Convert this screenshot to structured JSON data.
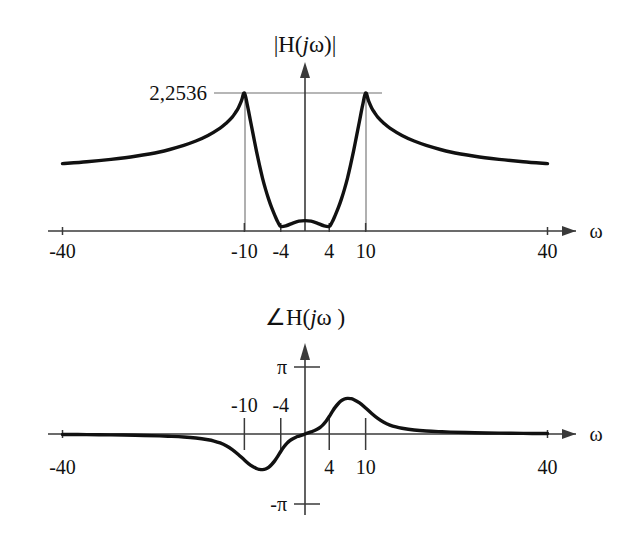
{
  "figure": {
    "axis_variable": "ω",
    "curve_color": "#111111",
    "axis_color": "#3a3a3a",
    "guide_color": "#6f6f6f",
    "background": "#ffffff"
  },
  "magnitude_plot": {
    "title_parts": {
      "pre": "|H(",
      "italic": "j",
      "post": "ω)|"
    },
    "title_text": "|H(jω)|",
    "axis_label": "ω",
    "peak_label": "2,2536",
    "x_tick_labels": [
      "-40",
      "-10",
      "-4",
      "4",
      "10",
      "40"
    ]
  },
  "phase_plot": {
    "title_parts": {
      "pre": "∠H(",
      "italic": "j",
      "post": "ω )"
    },
    "title_text": "∠H(jω )",
    "axis_label": "ω",
    "x_tick_labels": [
      "-40",
      "-10",
      "-4",
      "4",
      "10",
      "40"
    ],
    "y_tick_labels": [
      "π",
      "-π"
    ]
  },
  "chart_data": [
    {
      "type": "line",
      "id": "magnitude",
      "title": "|H(jω)|",
      "xlabel": "ω",
      "ylabel": "|H(jω)|",
      "xlim": [
        -40,
        40
      ],
      "ylim": [
        0,
        2.2536
      ],
      "grid": false,
      "legend": null,
      "xticks": [
        -40,
        -10,
        -4,
        4,
        10,
        40
      ],
      "xticklabels": [
        "-40",
        "-10",
        "-4",
        "4",
        "10",
        "40"
      ],
      "yticks": [
        2.2536
      ],
      "yticklabels": [
        "2,2536"
      ],
      "annotations": [
        {
          "text": "2,2536",
          "x": -16,
          "y": 2.2536,
          "note": "peak value guide line drawn from label across both resonance peaks"
        }
      ],
      "x": [
        -40,
        -36,
        -32,
        -28,
        -24,
        -20,
        -18,
        -16,
        -14,
        -13,
        -12,
        -11.5,
        -11,
        -10.5,
        -10,
        -9.5,
        -9,
        -8.5,
        -8,
        -7.5,
        -7,
        -6.5,
        -6,
        -5.5,
        -5,
        -4.5,
        -4,
        -3,
        -2,
        -1,
        0,
        1,
        2,
        3,
        4,
        4.5,
        5,
        5.5,
        6,
        6.5,
        7,
        7.5,
        8,
        8.5,
        9,
        9.5,
        10,
        10.5,
        11,
        11.5,
        12,
        13,
        14,
        16,
        18,
        20,
        24,
        28,
        32,
        36,
        40
      ],
      "y": [
        1.1,
        1.13,
        1.17,
        1.22,
        1.29,
        1.4,
        1.47,
        1.56,
        1.68,
        1.76,
        1.86,
        1.93,
        2.01,
        2.12,
        2.2536,
        2.05,
        1.8,
        1.55,
        1.3,
        1.07,
        0.86,
        0.68,
        0.52,
        0.38,
        0.26,
        0.15,
        0.075,
        0.09,
        0.13,
        0.16,
        0.17,
        0.16,
        0.13,
        0.09,
        0.075,
        0.15,
        0.26,
        0.38,
        0.52,
        0.68,
        0.86,
        1.07,
        1.3,
        1.55,
        1.8,
        2.05,
        2.2536,
        2.12,
        2.01,
        1.93,
        1.86,
        1.76,
        1.68,
        1.56,
        1.47,
        1.4,
        1.29,
        1.22,
        1.17,
        1.13,
        1.1
      ],
      "series_note": "Band-stop / twin-resonance magnitude response: peaks of 2,2536 at ω=±10, notch floor near ω=±4 with small local rise at ω=0, flat tails of about 1.1 at ω=±40."
    },
    {
      "type": "line",
      "id": "phase",
      "title": "∠H(jω )",
      "xlabel": "ω",
      "ylabel": "∠H(jω)",
      "xlim": [
        -40,
        40
      ],
      "ylim": [
        -3.14159,
        3.14159
      ],
      "grid": false,
      "legend": null,
      "xticks": [
        -40,
        -10,
        -4,
        4,
        10,
        40
      ],
      "xticklabels": [
        "-40",
        "-10",
        "-4",
        "4",
        "10",
        "40"
      ],
      "yticks": [
        3.14159,
        -3.14159
      ],
      "yticklabels": [
        "π",
        "-π"
      ],
      "x": [
        -40,
        -36,
        -32,
        -28,
        -24,
        -22,
        -20,
        -18,
        -16,
        -15,
        -14,
        -13,
        -12,
        -11,
        -10,
        -9,
        -8,
        -7.5,
        -7,
        -6.5,
        -6,
        -5.5,
        -5,
        -4.5,
        -4,
        -3.5,
        -3,
        -2.5,
        -2,
        -1.5,
        -1,
        -0.5,
        0,
        0.5,
        1,
        1.5,
        2,
        2.5,
        3,
        3.5,
        4,
        4.5,
        5,
        5.5,
        6,
        6.5,
        7,
        7.5,
        8,
        9,
        10,
        11,
        12,
        13,
        14,
        15,
        16,
        18,
        20,
        22,
        24,
        28,
        32,
        36,
        40
      ],
      "y": [
        -0.02,
        -0.03,
        -0.04,
        -0.06,
        -0.09,
        -0.11,
        -0.14,
        -0.19,
        -0.27,
        -0.33,
        -0.42,
        -0.55,
        -0.73,
        -0.96,
        -1.22,
        -1.46,
        -1.62,
        -1.66,
        -1.67,
        -1.64,
        -1.56,
        -1.43,
        -1.26,
        -1.05,
        -0.82,
        -0.61,
        -0.44,
        -0.31,
        -0.22,
        -0.15,
        -0.1,
        -0.05,
        0.0,
        0.05,
        0.1,
        0.15,
        0.22,
        0.31,
        0.44,
        0.61,
        0.82,
        1.05,
        1.26,
        1.43,
        1.56,
        1.64,
        1.67,
        1.66,
        1.62,
        1.46,
        1.22,
        0.96,
        0.73,
        0.55,
        0.42,
        0.33,
        0.27,
        0.19,
        0.14,
        0.11,
        0.09,
        0.06,
        0.04,
        0.03,
        0.02
      ],
      "series_note": "Odd-symmetric phase: dips to about -π/2 near ω=-7, rises through zero at ω=0, peaks near +π/2 around ω=7, decays to 0 at ±40."
    }
  ]
}
